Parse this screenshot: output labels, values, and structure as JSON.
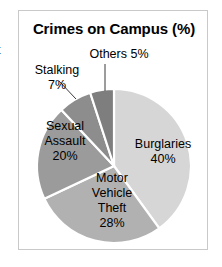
{
  "figure": {
    "title": "Crimes on Campus (%)",
    "margin_fragment": "t"
  },
  "labels": {
    "others": "Others 5%",
    "stalking_name": "Stalking",
    "stalking_value": "7%",
    "sexual_line1": "Sexual",
    "sexual_line2": "Assault",
    "sexual_line3": "20%",
    "burglaries_name": "Burglaries",
    "burglaries_value": "40%",
    "motor_line1": "Motor",
    "motor_line2": "Vehicle",
    "motor_line3": "Theft",
    "motor_line4": "28%"
  },
  "colors": {
    "burglaries": "#d6d6d6",
    "motor_vehicle_theft": "#b1b1b1",
    "sexual_assault": "#9b9b9b",
    "stalking": "#8d8d8d",
    "others": "#7e7e7e",
    "slice_divider": "#ffffff",
    "frame_border": "#c9c9c9",
    "text": "#000000",
    "background": "#ffffff"
  },
  "chart_data": {
    "type": "pie",
    "title": "Crimes on Campus (%)",
    "xlabel": "",
    "ylabel": "",
    "units": "%",
    "start_angle_deg": 0,
    "direction": "clockwise",
    "legend": "none",
    "labels_placement": "on-slice-with-leader-lines",
    "categories": [
      "Burglaries",
      "Motor Vehicle Theft",
      "Sexual Assault",
      "Stalking",
      "Others"
    ],
    "values": [
      40,
      28,
      20,
      7,
      5
    ],
    "value_labels": [
      "40%",
      "28%",
      "20%",
      "7%",
      "5%"
    ],
    "colors": [
      "#d6d6d6",
      "#b1b1b1",
      "#9b9b9b",
      "#8d8d8d",
      "#7e7e7e"
    ],
    "total": 100,
    "slices": [
      {
        "name": "Burglaries",
        "value": 40,
        "label": "Burglaries 40%",
        "color": "#d6d6d6",
        "start_deg": 0,
        "end_deg": 144
      },
      {
        "name": "Motor Vehicle Theft",
        "value": 28,
        "label": "Motor Vehicle Theft 28%",
        "color": "#b1b1b1",
        "start_deg": 144,
        "end_deg": 244.8
      },
      {
        "name": "Sexual Assault",
        "value": 20,
        "label": "Sexual Assault 20%",
        "color": "#9b9b9b",
        "start_deg": 244.8,
        "end_deg": 316.8
      },
      {
        "name": "Stalking",
        "value": 7,
        "label": "Stalking 7%",
        "color": "#8d8d8d",
        "start_deg": 316.8,
        "end_deg": 342
      },
      {
        "name": "Others",
        "value": 5,
        "label": "Others 5%",
        "color": "#7e7e7e",
        "start_deg": 342,
        "end_deg": 360
      }
    ]
  }
}
